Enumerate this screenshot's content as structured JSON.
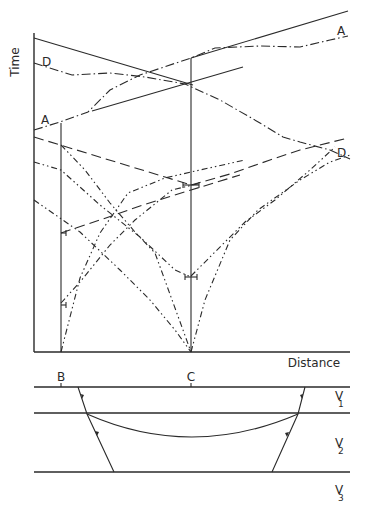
{
  "figure": {
    "axis_labels": {
      "y": "Time",
      "x": "Distance"
    },
    "curve_labels": {
      "a_left": "A",
      "a_right": "A",
      "d_left": "D",
      "d_right": "D"
    },
    "points": {
      "b": "B",
      "c": "C"
    },
    "layers": [
      {
        "label": "V",
        "subscript": "1"
      },
      {
        "label": "V",
        "subscript": "2"
      },
      {
        "label": "V",
        "subscript": "3"
      }
    ]
  }
}
